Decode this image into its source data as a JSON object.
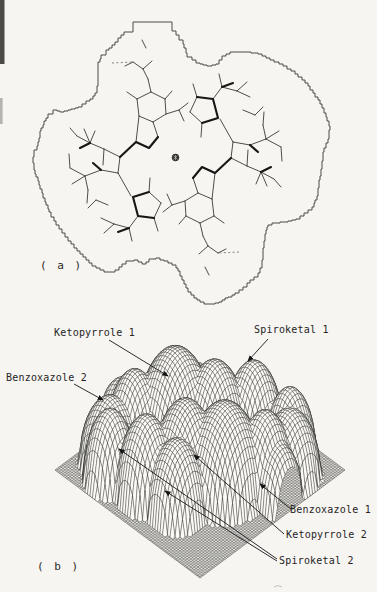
{
  "figure": {
    "panel_a": {
      "label": "( a )",
      "center_symbol": "inversion-center"
    },
    "panel_b": {
      "label": "( b )",
      "annotations": [
        {
          "id": "ketopyrrole-1",
          "text": "Ketopyrrole 1"
        },
        {
          "id": "spiroketal-1",
          "text": "Spiroketal 1"
        },
        {
          "id": "benzoxazole-2",
          "text": "Benzoxazole 2"
        },
        {
          "id": "benzoxazole-1",
          "text": "Benzoxazole 1"
        },
        {
          "id": "ketopyrrole-2",
          "text": "Ketopyrrole 2"
        },
        {
          "id": "spiroketal-2",
          "text": "Spiroketal 2"
        }
      ]
    },
    "colors": {
      "ink": "#2a2a2a",
      "paper": "#f6f5f2"
    }
  }
}
